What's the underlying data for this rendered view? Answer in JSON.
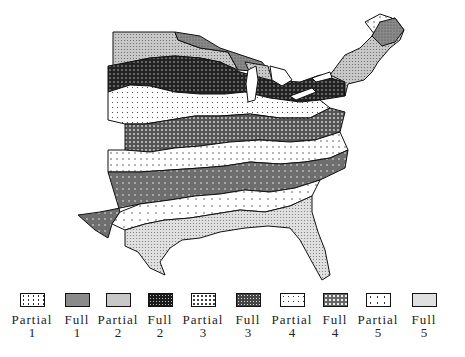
{
  "map": {
    "subject": "Eastern United States zone map",
    "regions": [
      {
        "id": "north-plains",
        "zone": "Partial 2"
      },
      {
        "id": "lake-superior-shore",
        "zone": "Full 1"
      },
      {
        "id": "north-central-band",
        "zone": "Full 2"
      },
      {
        "id": "central-plains",
        "zone": "Partial 3"
      },
      {
        "id": "mid-band",
        "zone": "Full 3"
      },
      {
        "id": "south-mid-band",
        "zone": "Partial 4"
      },
      {
        "id": "south-band",
        "zone": "Full 4"
      },
      {
        "id": "gulf-band",
        "zone": "Partial 5"
      },
      {
        "id": "gulf-coast-florida",
        "zone": "Full 5"
      },
      {
        "id": "maine-north",
        "zone": "Partial 1"
      }
    ]
  },
  "legend": {
    "items": [
      {
        "label": "Partial",
        "num": "1",
        "pattern": "partial1"
      },
      {
        "label": "Full",
        "num": "1",
        "pattern": "full1"
      },
      {
        "label": "Partial",
        "num": "2",
        "pattern": "partial2"
      },
      {
        "label": "Full",
        "num": "2",
        "pattern": "full2"
      },
      {
        "label": "Partial",
        "num": "3",
        "pattern": "partial3"
      },
      {
        "label": "Full",
        "num": "3",
        "pattern": "full3"
      },
      {
        "label": "Partial",
        "num": "4",
        "pattern": "partial4"
      },
      {
        "label": "Full",
        "num": "4",
        "pattern": "full4"
      },
      {
        "label": "Partial",
        "num": "5",
        "pattern": "partial5"
      },
      {
        "label": "Full",
        "num": "5",
        "pattern": "full5"
      }
    ]
  },
  "colors": {
    "outline": "#111111",
    "full1": "#7a7a7a",
    "full2": "#2a2a2a",
    "full3": "#555555",
    "full4": "#6a6a6a",
    "full5": "#bdbdbd",
    "partial2": "#a8a8a8"
  }
}
